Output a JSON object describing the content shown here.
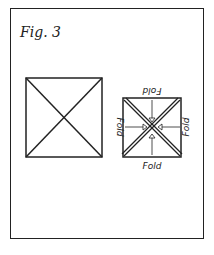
{
  "figure": {
    "title": "Fig. 3",
    "left_square": {
      "description": "square with two diagonals"
    },
    "right_square": {
      "description": "square with double-line diagonals and inward arrows",
      "labels": {
        "top": "Fold",
        "bottom": "Fold",
        "left": "Fold",
        "right": "Fold"
      }
    },
    "colors": {
      "ink": "#222222",
      "background": "#ffffff"
    }
  }
}
